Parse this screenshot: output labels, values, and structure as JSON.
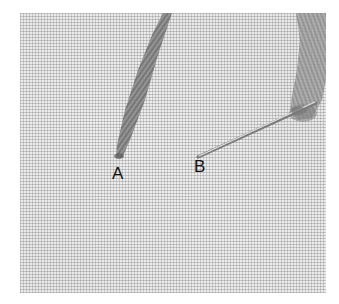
{
  "image": {
    "description": "Embroidery stitch illustration: thread emerging from fabric at point A, needle inserted at point B",
    "background_color": "#ffffff",
    "fabric_color": "#e9e9e9",
    "thread_color": "#8a8a8a",
    "needle_color": "#c8c8c8"
  },
  "labels": {
    "point_a": "A",
    "point_b": "B"
  },
  "elements": {
    "thread_a": {
      "start": [
        168,
        13
      ],
      "end": [
        118,
        158
      ]
    },
    "needle": {
      "tip": [
        198,
        157
      ],
      "eye": [
        316,
        103
      ]
    },
    "thread_b": {
      "top": [
        310,
        13
      ],
      "wrap": [
        305,
        110
      ]
    }
  }
}
